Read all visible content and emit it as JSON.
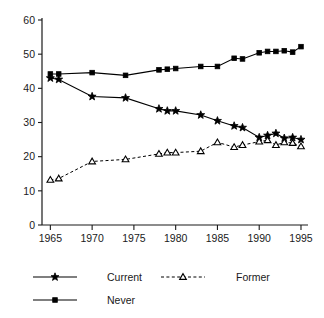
{
  "chart_data": {
    "type": "line",
    "title": "",
    "subtitle": "",
    "xlabel": "",
    "ylabel": "",
    "xlim": [
      1964,
      1995.6
    ],
    "ylim": [
      0,
      60
    ],
    "grid": false,
    "legend_position": "bottom",
    "x_ticks": [
      1965,
      1970,
      1975,
      1980,
      1985,
      1990,
      1995
    ],
    "x_tick_labels": [
      "1965",
      "1970",
      "1975",
      "1980",
      "1985",
      "1990",
      "1995"
    ],
    "y_ticks": [
      0,
      10,
      20,
      30,
      40,
      50,
      60
    ],
    "y_tick_labels": [
      "0",
      "10",
      "20",
      "30",
      "40",
      "50",
      "60"
    ],
    "series": [
      {
        "name": "Current",
        "marker": "star",
        "marker_fill": "filled",
        "linestyle": "solid",
        "color": "#000000",
        "x": [
          1965,
          1966,
          1970,
          1974,
          1978,
          1979,
          1980,
          1983,
          1985,
          1987,
          1988,
          1990,
          1991,
          1992,
          1993,
          1994,
          1995
        ],
        "values": [
          43.0,
          42.6,
          37.6,
          37.2,
          34.0,
          33.4,
          33.4,
          32.2,
          30.5,
          29.0,
          28.5,
          25.6,
          26.2,
          26.8,
          25.4,
          25.6,
          25.0
        ]
      },
      {
        "name": "Former",
        "marker": "triangle",
        "marker_fill": "open",
        "linestyle": "dashed",
        "color": "#000000",
        "x": [
          1965,
          1966,
          1970,
          1974,
          1978,
          1979,
          1980,
          1983,
          1985,
          1987,
          1988,
          1990,
          1991,
          1992,
          1993,
          1994,
          1995
        ],
        "values": [
          13.2,
          13.6,
          18.6,
          19.2,
          20.8,
          21.2,
          21.2,
          21.6,
          24.2,
          22.8,
          23.4,
          24.4,
          24.8,
          23.4,
          24.2,
          24.0,
          23.0
        ]
      },
      {
        "name": "Never",
        "marker": "square",
        "marker_fill": "filled",
        "linestyle": "solid",
        "color": "#000000",
        "x": [
          1965,
          1966,
          1970,
          1974,
          1978,
          1979,
          1980,
          1983,
          1985,
          1987,
          1988,
          1990,
          1991,
          1992,
          1993,
          1994,
          1995
        ],
        "values": [
          44.2,
          44.2,
          44.6,
          43.8,
          45.4,
          45.6,
          45.8,
          46.4,
          46.4,
          48.8,
          48.6,
          50.4,
          50.8,
          50.8,
          51.0,
          50.6,
          52.2
        ]
      }
    ],
    "legend": [
      {
        "label": "Current",
        "marker": "star",
        "marker_fill": "filled",
        "linestyle": "solid"
      },
      {
        "label": "Former",
        "marker": "triangle",
        "marker_fill": "open",
        "linestyle": "dashed"
      },
      {
        "label": "Never",
        "marker": "square",
        "marker_fill": "filled",
        "linestyle": "solid"
      }
    ]
  },
  "colors": {
    "ink": "#000000",
    "axis": "#1a1a1a",
    "background": "#ffffff"
  }
}
